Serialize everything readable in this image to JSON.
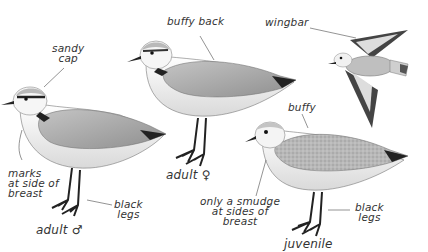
{
  "figure": {
    "labels": {
      "sandy_cap": [
        "sandy",
        "cap"
      ],
      "buffy_back": "buffy back",
      "wingbar": "wingbar",
      "buffy": "buffy",
      "marks_breast": [
        "marks",
        "at side of",
        "breast"
      ],
      "black_legs_male": [
        "black",
        "legs"
      ],
      "adult_male": "adult ♂",
      "adult_female": "adult ♀",
      "smudge_breast": [
        "only a smudge",
        "at sides of",
        "breast"
      ],
      "black_legs_juv": [
        "black",
        "legs"
      ],
      "juvenile": "juvenile"
    },
    "birds": [
      {
        "id": "adult-male",
        "pose": "standing"
      },
      {
        "id": "adult-female",
        "pose": "standing"
      },
      {
        "id": "flying",
        "pose": "in-flight"
      },
      {
        "id": "juvenile",
        "pose": "standing"
      }
    ],
    "colors": {
      "upperparts": "#a9a9a9",
      "underparts": "#f4f4f4",
      "dark": "#1f1f1f",
      "juvenile_back": "#b5b5b5",
      "label": "#333333"
    }
  }
}
